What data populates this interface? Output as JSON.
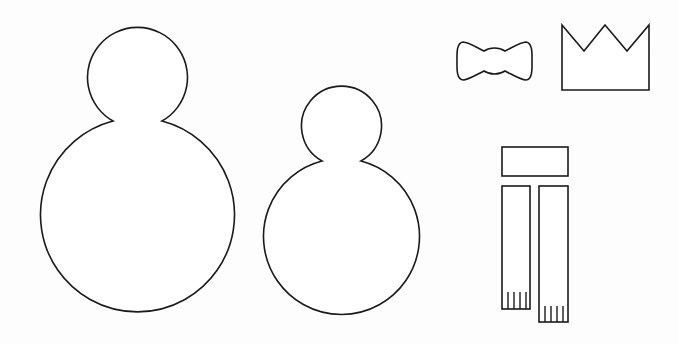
{
  "template": {
    "title": "",
    "background_color": "#fdfdfd",
    "stroke_color": "#1a1a1a",
    "pieces": [
      {
        "name": "large-snowman",
        "head": {
          "cx": 138,
          "cy": 76,
          "r": 50
        },
        "body": {
          "cx": 136,
          "cy": 222,
          "r": 97
        }
      },
      {
        "name": "small-snowman",
        "head": {
          "cx": 342,
          "cy": 123,
          "r": 40
        },
        "body": {
          "cx": 341,
          "cy": 240,
          "r": 78
        }
      },
      {
        "name": "bow-tie",
        "x": 457,
        "y": 41,
        "w": 75,
        "h": 39
      },
      {
        "name": "crown",
        "x": 562,
        "y": 24,
        "w": 87,
        "h": 66,
        "points": 3
      },
      {
        "name": "scarf-band",
        "x": 502,
        "y": 147,
        "w": 66,
        "h": 29
      },
      {
        "name": "scarf-end-left",
        "x": 502,
        "y": 186,
        "w": 28,
        "h": 123,
        "fringe_lines": 4
      },
      {
        "name": "scarf-end-right",
        "x": 539,
        "y": 186,
        "w": 29,
        "h": 136,
        "fringe_lines": 4
      }
    ]
  }
}
